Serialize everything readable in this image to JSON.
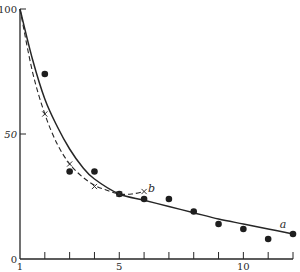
{
  "chart_data": {
    "type": "scatter",
    "title": "",
    "xlabel": "",
    "ylabel": "",
    "xlim": [
      1,
      12
    ],
    "ylim": [
      0,
      100
    ],
    "grid": false,
    "legend": null,
    "x_ticks": [
      1,
      2,
      3,
      4,
      5,
      6,
      7,
      8,
      9,
      10,
      11,
      12
    ],
    "x_tick_labels": [
      {
        "x": 1,
        "label": "1"
      },
      {
        "x": 5,
        "label": "5"
      },
      {
        "x": 10,
        "label": "10"
      }
    ],
    "y_tick_labels": [
      {
        "y": 0,
        "label": "0"
      },
      {
        "y": 50,
        "label": "50"
      },
      {
        "y": 100,
        "label": "100"
      }
    ],
    "series": [
      {
        "name": "dots",
        "marker": "filled-circle",
        "points": [
          {
            "x": 2,
            "y": 74
          },
          {
            "x": 3,
            "y": 35
          },
          {
            "x": 4,
            "y": 35
          },
          {
            "x": 5,
            "y": 26
          },
          {
            "x": 6,
            "y": 24
          },
          {
            "x": 7,
            "y": 24
          },
          {
            "x": 8,
            "y": 19
          },
          {
            "x": 9,
            "y": 14
          },
          {
            "x": 10,
            "y": 12
          },
          {
            "x": 11,
            "y": 8
          },
          {
            "x": 12,
            "y": 10
          }
        ]
      },
      {
        "name": "crosses",
        "marker": "x",
        "points": [
          {
            "x": 2,
            "y": 58
          },
          {
            "x": 3,
            "y": 38
          },
          {
            "x": 4,
            "y": 29
          },
          {
            "x": 5,
            "y": 26
          },
          {
            "x": 6,
            "y": 27
          }
        ]
      },
      {
        "name": "a",
        "style": "solid-curve",
        "label": "a",
        "points": [
          {
            "x": 1,
            "y": 100
          },
          {
            "x": 1.5,
            "y": 80
          },
          {
            "x": 2,
            "y": 64
          },
          {
            "x": 2.5,
            "y": 53
          },
          {
            "x": 3,
            "y": 44
          },
          {
            "x": 3.5,
            "y": 37
          },
          {
            "x": 4,
            "y": 32
          },
          {
            "x": 5,
            "y": 26
          },
          {
            "x": 6,
            "y": 23.5
          },
          {
            "x": 7,
            "y": 21
          },
          {
            "x": 8,
            "y": 18.5
          },
          {
            "x": 9,
            "y": 16
          },
          {
            "x": 10,
            "y": 14
          },
          {
            "x": 11,
            "y": 12
          },
          {
            "x": 12,
            "y": 10
          }
        ]
      },
      {
        "name": "b",
        "style": "dashed-curve",
        "label": "b",
        "points": [
          {
            "x": 1,
            "y": 100
          },
          {
            "x": 1.5,
            "y": 75
          },
          {
            "x": 2,
            "y": 58
          },
          {
            "x": 2.5,
            "y": 46
          },
          {
            "x": 3,
            "y": 38
          },
          {
            "x": 3.5,
            "y": 33
          },
          {
            "x": 4,
            "y": 29.5
          },
          {
            "x": 4.5,
            "y": 27.5
          },
          {
            "x": 5,
            "y": 26
          },
          {
            "x": 5.5,
            "y": 26
          },
          {
            "x": 6,
            "y": 27
          }
        ]
      }
    ],
    "annotations": [
      {
        "text": "a",
        "x": 11.6,
        "y": 12.5
      },
      {
        "text": "b",
        "x": 6.3,
        "y": 27
      }
    ]
  }
}
